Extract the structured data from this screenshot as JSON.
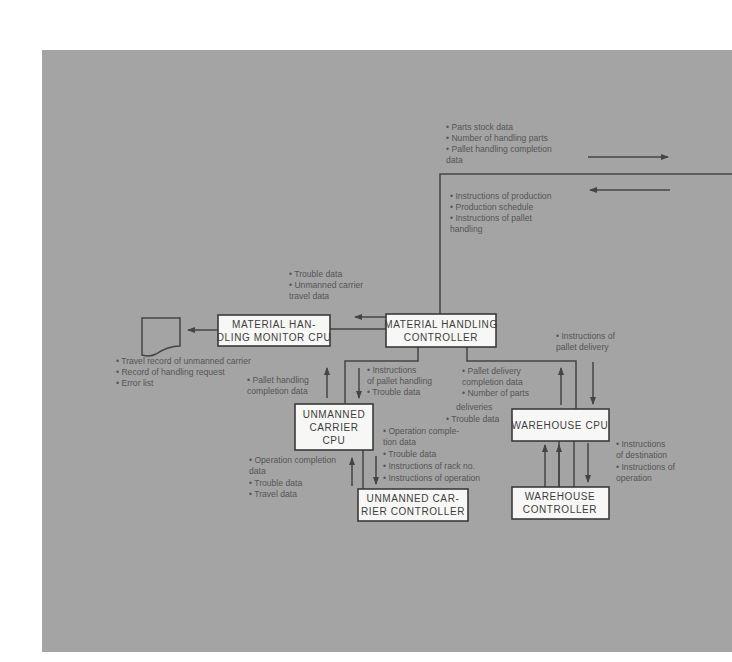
{
  "diagram": {
    "type": "system-block-diagram",
    "boxes": {
      "mh_controller": [
        "MATERIAL HANDLING",
        "CONTROLLER"
      ],
      "mh_monitor": [
        "MATERIAL HAN-",
        "DLING MONITOR CPU"
      ],
      "carrier_cpu": [
        "UNMANNED",
        "CARRIER",
        "CPU"
      ],
      "carrier_controller": [
        "UNMANNED CAR-",
        "RIER CONTROLLER"
      ],
      "warehouse_cpu": [
        "WAREHOUSE CPU"
      ],
      "warehouse_controller": [
        "WAREHOUSE",
        "CONTROLLER"
      ]
    },
    "notes": {
      "upstream_out": [
        "• Parts stock data",
        "• Number of handling parts",
        "• Pallet handling completion",
        "  data"
      ],
      "upstream_in": [
        "• Instructions of production",
        "• Production schedule",
        "• Instructions of pallet",
        "  handling"
      ],
      "to_monitor": [
        "• Trouble data",
        "• Unmanned carrier",
        "  travel data"
      ],
      "monitor_output": [
        "• Travel record of unmanned carrier",
        "• Record of handling request",
        "• Error list"
      ],
      "carrier_up": [
        "• Pallet handling",
        "  completion data"
      ],
      "carrier_down": [
        "• Instructions",
        "  of pallet handling",
        "• Trouble data"
      ],
      "warehouse_up": [
        "• Pallet delivery",
        "  completion data",
        "• Number of parts",
        "deliveries",
        "• Trouble data"
      ],
      "warehouse_down": [
        "• Instructions of",
        "  pallet delivery"
      ],
      "cc_down": [
        "• Operation comple-",
        "  tion data",
        "• Trouble data",
        "• Instructions of rack no.",
        "• Instructions of operation"
      ],
      "cc_up": [
        "• Operation completion",
        "  data",
        "• Trouble data",
        "• Travel data"
      ],
      "wc_down": [
        "• Instructions",
        "  of destination",
        "• Instructions of",
        "  operation"
      ]
    }
  }
}
